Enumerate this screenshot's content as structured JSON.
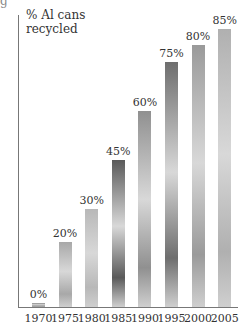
{
  "chart_data": {
    "type": "bar",
    "title": "",
    "ylabel": "% Al cans recycled",
    "xlabel": "",
    "categories": [
      "1970",
      "1975",
      "1980",
      "1985",
      "1990",
      "1995",
      "2000",
      "2005"
    ],
    "values": [
      0,
      20,
      30,
      45,
      60,
      75,
      80,
      85
    ],
    "value_labels": [
      "0%",
      "20%",
      "30%",
      "45%",
      "60%",
      "75%",
      "80%",
      "85%"
    ],
    "ylim": [
      0,
      90
    ],
    "grid": false,
    "legend": null,
    "bar_colors": [
      "#8a8a8a",
      "#a8a8a8",
      "#b8b8b8",
      "#5a5a5a",
      "#909090",
      "#6e6e6e",
      "#9a9a9a",
      "#b0b0b0"
    ]
  },
  "fragment_text": "g"
}
